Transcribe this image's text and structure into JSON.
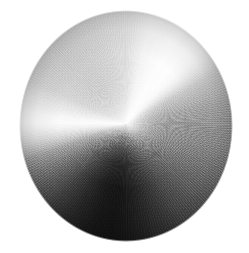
{
  "image": {
    "title": "Brushed metal disc",
    "subject": "circular brushed aluminium plate with radial spun finish",
    "background_color": "#ffffff",
    "canvas": {
      "width": 249,
      "height": 253
    }
  },
  "disc": {
    "name": "metal-disc",
    "shape": "ellipse",
    "center_x": 126,
    "center_y": 126,
    "radius_x": 107,
    "radius_y": 116,
    "left": 19,
    "top": 10,
    "width": 214,
    "height": 232,
    "finish": "spun / circular-brushed",
    "material": "aluminium"
  },
  "lighting": {
    "specular_center_x": 126,
    "specular_center_y": 122,
    "highlight_color": "#fcfcfc",
    "highlight_angle_deg": 38,
    "secondary_highlight_angle_deg": 271,
    "shadow_angle_deg": 186,
    "shadow_color": "#2b2b2b"
  },
  "tones": {
    "brightest": "#fcfcfc",
    "upper_left": "#c5c5c5",
    "right_mid": "#8a8a8a",
    "lower_right": "#545454",
    "lower_left": "#2a2a2a",
    "darkest": "#2b2b2b",
    "rim_shadow": "#303030"
  },
  "texture": {
    "type": "radial-brush-grain",
    "grain_opacity": 0.3,
    "speckle_opacity": 0.13
  }
}
